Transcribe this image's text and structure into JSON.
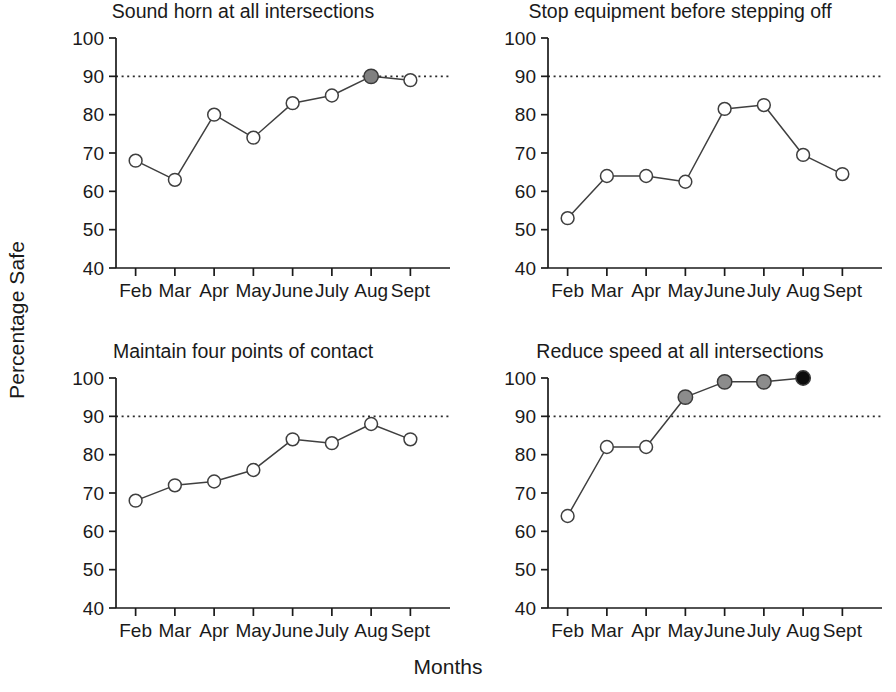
{
  "figure": {
    "ylabel": "Percentage Safe",
    "xlabel": "Months"
  },
  "chart_data": [
    {
      "type": "line",
      "title": "Sound horn at all intersections",
      "xlabel": "Months",
      "ylabel": "Percentage Safe",
      "categories": [
        "Feb",
        "Mar",
        "Apr",
        "May",
        "June",
        "July",
        "Aug",
        "Sept"
      ],
      "values": [
        68,
        63,
        80,
        74,
        83,
        85,
        90,
        89
      ],
      "marker_fills": [
        "#ffffff",
        "#ffffff",
        "#ffffff",
        "#ffffff",
        "#ffffff",
        "#ffffff",
        "#808080",
        "#ffffff"
      ],
      "ylim": [
        40,
        100
      ],
      "yticks": [
        40,
        50,
        60,
        70,
        80,
        90,
        100
      ],
      "goal_line": 90,
      "goal_line_style": "dotted",
      "grid": false,
      "legend": "none"
    },
    {
      "type": "line",
      "title": "Stop equipment before stepping off",
      "xlabel": "Months",
      "ylabel": "Percentage Safe",
      "categories": [
        "Feb",
        "Mar",
        "Apr",
        "May",
        "June",
        "July",
        "Aug",
        "Sept"
      ],
      "values": [
        53,
        64,
        64,
        62.5,
        81.5,
        82.5,
        69.5,
        64.5
      ],
      "marker_fills": [
        "#ffffff",
        "#ffffff",
        "#ffffff",
        "#ffffff",
        "#ffffff",
        "#ffffff",
        "#ffffff",
        "#ffffff"
      ],
      "ylim": [
        40,
        100
      ],
      "yticks": [
        40,
        50,
        60,
        70,
        80,
        90,
        100
      ],
      "goal_line": 90,
      "goal_line_style": "dotted",
      "grid": false,
      "legend": "none"
    },
    {
      "type": "line",
      "title": "Maintain four points of contact",
      "xlabel": "Months",
      "ylabel": "Percentage Safe",
      "categories": [
        "Feb",
        "Mar",
        "Apr",
        "May",
        "June",
        "July",
        "Aug",
        "Sept"
      ],
      "values": [
        68,
        72,
        73,
        76,
        84,
        83,
        88,
        84
      ],
      "marker_fills": [
        "#ffffff",
        "#ffffff",
        "#ffffff",
        "#ffffff",
        "#ffffff",
        "#ffffff",
        "#ffffff",
        "#ffffff"
      ],
      "ylim": [
        40,
        100
      ],
      "yticks": [
        40,
        50,
        60,
        70,
        80,
        90,
        100
      ],
      "goal_line": 90,
      "goal_line_style": "dotted",
      "grid": false,
      "legend": "none"
    },
    {
      "type": "line",
      "title": "Reduce speed at all intersections",
      "xlabel": "Months",
      "ylabel": "Percentage Safe",
      "categories": [
        "Feb",
        "Mar",
        "Apr",
        "May",
        "June",
        "July",
        "Aug",
        "Sept"
      ],
      "values": [
        64,
        82,
        82,
        95,
        99,
        99,
        100,
        null
      ],
      "marker_fills": [
        "#ffffff",
        "#ffffff",
        "#ffffff",
        "#8c8c8c",
        "#8c8c8c",
        "#8c8c8c",
        "#0d0d0d",
        null
      ],
      "ylim": [
        40,
        100
      ],
      "yticks": [
        40,
        50,
        60,
        70,
        80,
        90,
        100
      ],
      "goal_line": 90,
      "goal_line_style": "dotted",
      "grid": false,
      "legend": "none"
    }
  ],
  "panels": [
    {
      "title": "Sound horn at all intersections"
    },
    {
      "title": "Stop equipment before stepping off"
    },
    {
      "title": "Maintain four points of contact"
    },
    {
      "title": "Reduce speed at all intersections"
    }
  ],
  "colors": {
    "line": "#3f3f3f",
    "axis": "#1a1a1a",
    "goal": "#2b2b2b",
    "marker_open": "#ffffff",
    "marker_gray": "#808080",
    "marker_black": "#0d0d0d"
  }
}
